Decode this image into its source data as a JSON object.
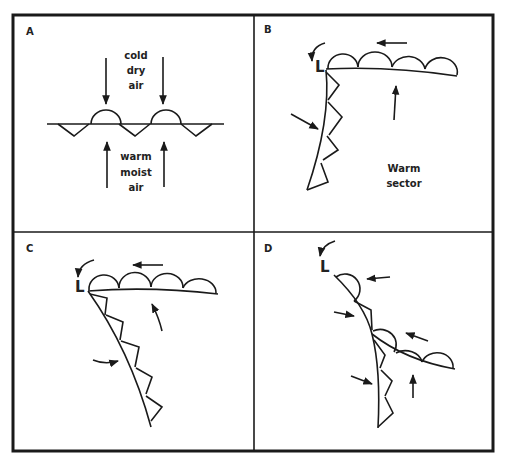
{
  "figure": {
    "panels": [
      {
        "id": "A",
        "label": "A",
        "stage": "stationary front",
        "text_top": [
          "cold",
          "dry",
          "air"
        ],
        "text_bottom": [
          "warm",
          "moist",
          "air"
        ]
      },
      {
        "id": "B",
        "label": "B",
        "stage": "incipient wave",
        "low_label": "L",
        "text": [
          "Warm",
          "sector"
        ]
      },
      {
        "id": "C",
        "label": "C",
        "stage": "mature cyclone",
        "low_label": "L"
      },
      {
        "id": "D",
        "label": "D",
        "stage": "occlusion",
        "low_label": "L"
      }
    ]
  },
  "colors": {
    "ink": "#1a1a1a",
    "background": "#ffffff"
  }
}
